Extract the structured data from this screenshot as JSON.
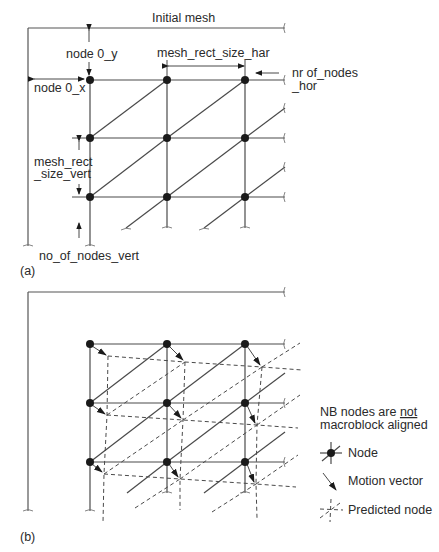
{
  "panel_a": {
    "title": "Initial mesh",
    "label": "(a)",
    "annotations": {
      "node0_y": "node 0_y",
      "node0_x": "node 0_x",
      "rect_size_hor": "mesh_rect_size_har",
      "nodes_hor_line1": "nr of_nodes",
      "nodes_hor_line2": "_hor",
      "rect_size_vert_line1": "mesh_rect",
      "rect_size_vert_line2": "_size_vert",
      "nodes_vert": "no_of_nodes_vert"
    },
    "grid": {
      "columns_x": [
        90,
        167,
        245
      ],
      "rows_y": [
        80,
        138,
        197
      ]
    }
  },
  "panel_b": {
    "label": "(b)",
    "note_line1": "NB nodes are ",
    "note_emphasis": "not",
    "note_line2": "macroblock aligned",
    "legend": [
      {
        "icon": "node-icon",
        "label": "Node"
      },
      {
        "icon": "motion-vector-icon",
        "label": "Motion vector"
      },
      {
        "icon": "predicted-node-icon",
        "label": "Predicted node"
      }
    ],
    "grid": {
      "columns_x": [
        90,
        167,
        245
      ],
      "rows_y": [
        344,
        403,
        462
      ]
    }
  },
  "colors": {
    "line": "#4a4a4a",
    "node": "#1a1a1a",
    "text": "#2a2a2a"
  }
}
